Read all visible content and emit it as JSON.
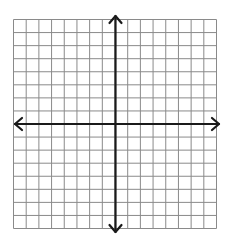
{
  "diagram": {
    "type": "coordinate-plane",
    "grid": {
      "columns": 16,
      "rows": 16,
      "line_color": "#8a8a8a"
    },
    "axes": {
      "x_axis_row": 8,
      "y_axis_column": 8,
      "color": "#1a1a1a",
      "arrows": [
        "left",
        "right",
        "up",
        "down"
      ]
    },
    "labels": []
  }
}
